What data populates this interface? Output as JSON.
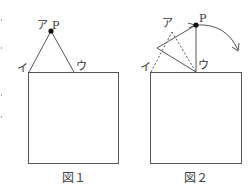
{
  "figure1": {
    "caption": "図１",
    "labels": {
      "a": "ア",
      "p": "P",
      "i": "イ",
      "u": "ウ"
    }
  },
  "figure2": {
    "caption": "図２",
    "labels": {
      "a": "ア",
      "p": "P",
      "i": "イ",
      "u": "ウ"
    }
  },
  "colors": {
    "line": "#555555",
    "dot": "#111111"
  }
}
